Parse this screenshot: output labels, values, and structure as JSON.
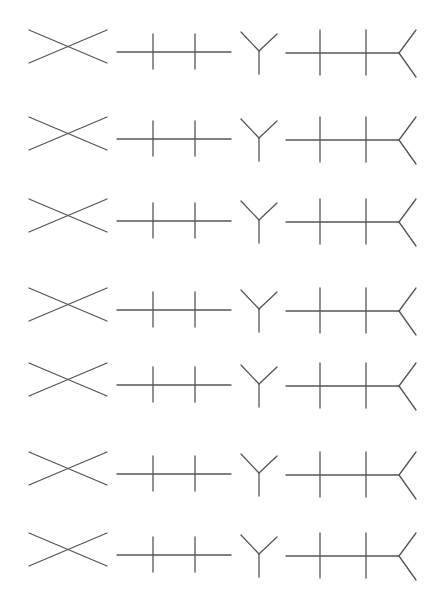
{
  "figure": {
    "stroke_color": "#555555",
    "stroke_width": 1.3,
    "background": "#ffffff"
  },
  "rows": [
    {
      "index": 1,
      "center_y": 47
    },
    {
      "index": 2,
      "center_y": 134
    },
    {
      "index": 3,
      "center_y": 216
    },
    {
      "index": 4,
      "center_y": 305
    },
    {
      "index": 5,
      "center_y": 380
    },
    {
      "index": 6,
      "center_y": 469
    },
    {
      "index": 7,
      "center_y": 550
    }
  ],
  "shapes": [
    {
      "name": "x-cross",
      "label": "X shape"
    },
    {
      "name": "ticked-line",
      "label": "horizontal line with two vertical ticks"
    },
    {
      "name": "y-fork",
      "label": "Y shape"
    },
    {
      "name": "ticked-line-with-fork",
      "label": "horizontal line with two ticks ending in a fork"
    }
  ]
}
